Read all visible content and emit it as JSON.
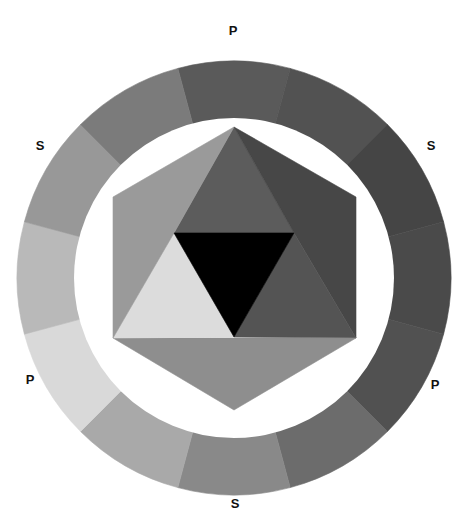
{
  "diagram": {
    "center": [
      234,
      278
    ],
    "outer_radius": 217,
    "inner_radius": 160,
    "ring_segments": [
      {
        "position": 12,
        "type": "P",
        "color": "#5a5a5a"
      },
      {
        "position": 1,
        "type": "T",
        "color": "#525252"
      },
      {
        "position": 2,
        "type": "S",
        "color": "#454545"
      },
      {
        "position": 3,
        "type": "T",
        "color": "#4a4a4a"
      },
      {
        "position": 4,
        "type": "P",
        "color": "#515151"
      },
      {
        "position": 5,
        "type": "T",
        "color": "#6c6c6c"
      },
      {
        "position": 6,
        "type": "S",
        "color": "#898989"
      },
      {
        "position": 7,
        "type": "T",
        "color": "#a9a9a9"
      },
      {
        "position": 8,
        "type": "P",
        "color": "#d9d9d9"
      },
      {
        "position": 9,
        "type": "T",
        "color": "#b9b9b9"
      },
      {
        "position": 10,
        "type": "S",
        "color": "#989898"
      },
      {
        "position": 11,
        "type": "T",
        "color": "#7b7b7b"
      }
    ],
    "hexagon": {
      "vertices": [
        [
          234,
          127
        ],
        [
          356,
          197
        ],
        [
          356,
          338
        ],
        [
          234,
          410
        ],
        [
          113,
          338
        ],
        [
          113,
          197
        ]
      ]
    },
    "inner_triangles": [
      {
        "name": "top-triangle",
        "points": [
          [
            234,
            127
          ],
          [
            294,
            233
          ],
          [
            174,
            233
          ]
        ],
        "color": "#5c5c5c"
      },
      {
        "name": "upper-right-triangle",
        "points": [
          [
            234,
            127
          ],
          [
            356,
            197
          ],
          [
            356,
            338
          ],
          [
            294,
            233
          ]
        ],
        "color": "#474747"
      },
      {
        "name": "lower-right-triangle",
        "points": [
          [
            294,
            233
          ],
          [
            356,
            338
          ],
          [
            234,
            337
          ]
        ],
        "color": "#545454"
      },
      {
        "name": "bottom-triangle",
        "points": [
          [
            113,
            338
          ],
          [
            356,
            338
          ],
          [
            234,
            410
          ]
        ],
        "color": "#8e8e8e"
      },
      {
        "name": "lower-left-triangle",
        "points": [
          [
            174,
            233
          ],
          [
            234,
            337
          ],
          [
            113,
            338
          ]
        ],
        "color": "#dcdcdc"
      },
      {
        "name": "upper-left-triangle",
        "points": [
          [
            234,
            127
          ],
          [
            174,
            233
          ],
          [
            113,
            338
          ],
          [
            113,
            197
          ]
        ],
        "color": "#9a9a9a"
      },
      {
        "name": "center-triangle",
        "points": [
          [
            174,
            233
          ],
          [
            294,
            233
          ],
          [
            234,
            337
          ]
        ],
        "color": "#000000"
      }
    ],
    "labels": [
      {
        "text": "P",
        "x": 233,
        "y": 30
      },
      {
        "text": "S",
        "x": 40,
        "y": 145
      },
      {
        "text": "S",
        "x": 431,
        "y": 145
      },
      {
        "text": "P",
        "x": 30,
        "y": 379
      },
      {
        "text": "P",
        "x": 435,
        "y": 384
      },
      {
        "text": "S",
        "x": 235,
        "y": 503
      }
    ]
  }
}
